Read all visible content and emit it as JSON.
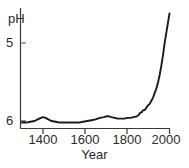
{
  "chart_data": {
    "type": "line",
    "title": "",
    "xlabel": "Year",
    "ylabel": "pH",
    "xlim": [
      1300,
      2010
    ],
    "ylim": [
      6.15,
      4.55
    ],
    "y_axis_inverted": true,
    "grid": false,
    "legend": null,
    "xticks": [
      1400,
      1600,
      1800,
      2000
    ],
    "xtick_labels": [
      "1400",
      "1600",
      "1800",
      "2000"
    ],
    "yticks": [
      5,
      6
    ],
    "ytick_labels": [
      "5",
      "6"
    ],
    "line_color": "#1a1a1a",
    "axis_color": "#3a3a3a",
    "series": [
      {
        "name": "pH",
        "x": [
          1300,
          1320,
          1340,
          1360,
          1375,
          1390,
          1400,
          1412,
          1425,
          1440,
          1460,
          1480,
          1500,
          1520,
          1545,
          1570,
          1590,
          1610,
          1630,
          1650,
          1670,
          1690,
          1700,
          1712,
          1725,
          1740,
          1755,
          1770,
          1785,
          1800,
          1815,
          1830,
          1845,
          1855,
          1862,
          1868,
          1875,
          1882,
          1890,
          1898,
          1906,
          1914,
          1922,
          1930,
          1938,
          1946,
          1954,
          1962,
          1970,
          1978,
          1986,
          1994,
          2000
        ],
        "y": [
          6.02,
          6.02,
          6.01,
          6.0,
          5.98,
          5.96,
          5.95,
          5.96,
          5.98,
          6.0,
          6.01,
          6.02,
          6.02,
          6.02,
          6.02,
          6.02,
          6.01,
          6.0,
          5.99,
          5.98,
          5.96,
          5.95,
          5.94,
          5.94,
          5.95,
          5.96,
          5.97,
          5.97,
          5.97,
          5.96,
          5.96,
          5.95,
          5.94,
          5.92,
          5.89,
          5.89,
          5.86,
          5.86,
          5.83,
          5.8,
          5.78,
          5.74,
          5.7,
          5.64,
          5.58,
          5.5,
          5.4,
          5.28,
          5.14,
          4.98,
          4.85,
          4.72,
          4.62
        ]
      }
    ]
  },
  "labels": {
    "y_axis_title": "pH",
    "x_axis_title": "Year",
    "ytick_5": "5",
    "ytick_6": "6",
    "xtick_1400": "1400",
    "xtick_1600": "1600",
    "xtick_1800": "1800",
    "xtick_2000": "2000"
  }
}
